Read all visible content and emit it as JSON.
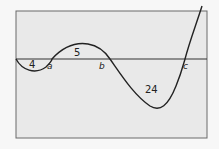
{
  "diagram": {
    "frame": {
      "x": 16,
      "y": 11,
      "width": 191,
      "height": 127,
      "fill": "#e9e9e9",
      "stroke": "#555555"
    },
    "axis_y": 59,
    "curve_path": "M16,59 C22,70 35,75 46,67 C50,63 52,60 52,59 C62,48 75,42 88,44 C100,46 106,53 110,59 C122,76 134,95 150,106 C160,112 168,106 176,86 C181,74 183,66 185,59 C190,40 196,25 205,0",
    "points": [
      {
        "name": "a",
        "x": 52,
        "y": 59
      },
      {
        "name": "b",
        "x": 110,
        "y": 59
      },
      {
        "name": "c",
        "x": 185,
        "y": 59
      }
    ],
    "labels": {
      "a": "a",
      "b": "b",
      "c": "c"
    },
    "areas": {
      "region1": "4",
      "region2": "5",
      "region3": "24"
    }
  }
}
